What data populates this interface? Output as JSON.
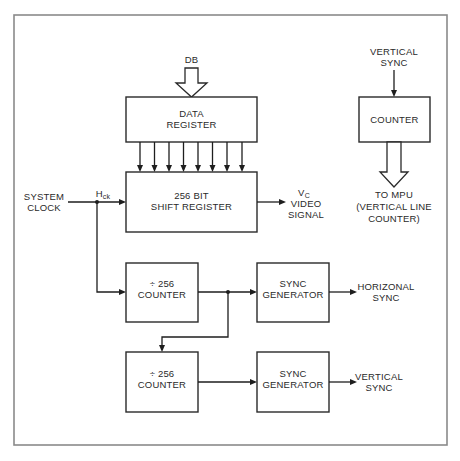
{
  "diagram": {
    "type": "block-diagram",
    "top_input": {
      "label": "DB"
    },
    "blocks": {
      "data_register": {
        "line1": "DATA",
        "line2": "REGISTER"
      },
      "shift_register": {
        "line1": "256 BIT",
        "line2": "SHIFT REGISTER"
      },
      "counter_h": {
        "line1": "÷ 256",
        "line2": "COUNTER"
      },
      "counter_v": {
        "line1": "÷ 256",
        "line2": "COUNTER"
      },
      "sync_gen_h": {
        "line1": "SYNC",
        "line2": "GENERATOR"
      },
      "sync_gen_v": {
        "line1": "SYNC",
        "line2": "GENERATOR"
      },
      "line_counter": {
        "line1": "COUNTER"
      }
    },
    "signals": {
      "system_clock": {
        "line1": "SYSTEM",
        "line2": "CLOCK"
      },
      "hck": {
        "main": "H",
        "sub": "ck"
      },
      "video_out": {
        "main": "V",
        "sub": "C",
        "line2": "VIDEO",
        "line3": "SIGNAL"
      },
      "horizontal_sync": {
        "line1": "HORIZONAL",
        "line2": "SYNC"
      },
      "vertical_sync_out": {
        "line1": "VERTICAL",
        "line2": "SYNC"
      },
      "vertical_sync_in": {
        "line1": "VERTICAL",
        "line2": "SYNC"
      },
      "to_mpu": {
        "line1": "TO MPU",
        "line2": "(VERTICAL LINE",
        "line3": "COUNTER)"
      }
    },
    "parallel_lines": 8,
    "colors": {
      "line": "#1e1e1e",
      "frame": "#8a8a8a",
      "background": "#ffffff"
    }
  }
}
